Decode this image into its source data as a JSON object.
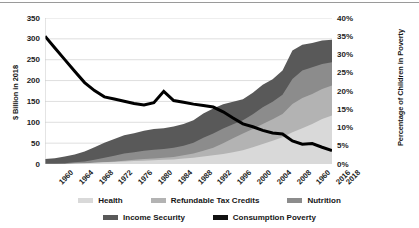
{
  "chart_data": {
    "type": "area",
    "title": "",
    "subtitle": "",
    "xlabel": "",
    "ylabel": "$ Billion in 2018",
    "y2label": "Percentage of Children in Poverty",
    "grid": true,
    "legend_position": "bottom",
    "xlim": [
      1960,
      2018
    ],
    "ylim": [
      0,
      350
    ],
    "y2lim": [
      0,
      40
    ],
    "x": [
      1960,
      1962,
      1964,
      1966,
      1968,
      1970,
      1972,
      1974,
      1976,
      1978,
      1980,
      1982,
      1984,
      1986,
      1988,
      1990,
      1992,
      1994,
      1996,
      1998,
      2000,
      2002,
      2004,
      2006,
      2008,
      2010,
      2012,
      2014,
      2016,
      2018
    ],
    "x_tick_labels": [
      "1960",
      "1964",
      "1968",
      "1972",
      "1976",
      "1980",
      "1984",
      "1988",
      "1992",
      "1996",
      "2000",
      "2004",
      "2008",
      "1960",
      "2016",
      "2018"
    ],
    "y_tick_labels": [
      "350",
      "300",
      "250",
      "200",
      "150",
      "100",
      "50",
      "0"
    ],
    "y2_tick_labels": [
      "40%",
      "35%",
      "30%",
      "25%",
      "20%",
      "15%",
      "10%",
      "5%",
      "0%"
    ],
    "stack_order_bottom_to_top": [
      "Health",
      "Refundable Tax Credits",
      "Nutrition",
      "Income Security"
    ],
    "series": [
      {
        "name": "Health",
        "kind": "area",
        "axis": "left",
        "color": "#d9d9d9",
        "values": [
          0,
          0,
          0,
          1,
          2,
          3,
          4,
          5,
          6,
          7,
          8,
          9,
          10,
          11,
          13,
          15,
          18,
          21,
          24,
          28,
          33,
          40,
          48,
          56,
          64,
          76,
          86,
          96,
          108,
          116
        ]
      },
      {
        "name": "Refundable Tax Credits",
        "kind": "area",
        "axis": "left",
        "color": "#b3b3b3",
        "values": [
          0,
          0,
          0,
          0,
          0,
          0,
          0,
          1,
          2,
          3,
          4,
          4,
          5,
          6,
          8,
          10,
          14,
          18,
          26,
          34,
          40,
          44,
          48,
          51,
          56,
          68,
          72,
          72,
          72,
          72
        ]
      },
      {
        "name": "Nutrition",
        "kind": "area",
        "axis": "left",
        "color": "#8c8c8c",
        "values": [
          1,
          1,
          2,
          3,
          4,
          7,
          11,
          14,
          17,
          18,
          20,
          21,
          21,
          22,
          23,
          26,
          31,
          34,
          35,
          33,
          32,
          35,
          40,
          42,
          46,
          60,
          66,
          64,
          60,
          56
        ]
      },
      {
        "name": "Income Security",
        "kind": "area",
        "axis": "left",
        "color": "#595959",
        "values": [
          11,
          13,
          16,
          19,
          24,
          30,
          36,
          40,
          44,
          46,
          48,
          50,
          50,
          51,
          52,
          54,
          58,
          60,
          58,
          54,
          50,
          52,
          54,
          54,
          58,
          68,
          62,
          58,
          56,
          54
        ]
      },
      {
        "name": "Consumption Poverty",
        "kind": "line",
        "axis": "right",
        "color": "#000000",
        "values": [
          35.0,
          31.8,
          28.6,
          25.4,
          22.3,
          20.1,
          18.4,
          17.8,
          17.2,
          16.6,
          16.2,
          16.8,
          19.9,
          17.4,
          16.9,
          16.4,
          16.0,
          15.6,
          14.3,
          12.6,
          11.0,
          10.2,
          9.2,
          8.5,
          8.2,
          6.3,
          5.4,
          5.6,
          4.6,
          3.7
        ]
      }
    ]
  },
  "axes": {
    "y_left": {
      "title": "$ Billion in 2018",
      "ticks": [
        "350",
        "300",
        "250",
        "200",
        "150",
        "100",
        "50",
        "0"
      ]
    },
    "y_right": {
      "title": "Percentage of Children in Poverty",
      "ticks": [
        "40%",
        "35%",
        "30%",
        "25%",
        "20%",
        "15%",
        "10%",
        "5%",
        "0%"
      ]
    },
    "x": {
      "ticks": [
        "1960",
        "1964",
        "1968",
        "1972",
        "1976",
        "1980",
        "1984",
        "1988",
        "1992",
        "1996",
        "2000",
        "2004",
        "2008",
        "1960",
        "2016",
        "2018"
      ]
    }
  },
  "legend": {
    "rows": [
      [
        {
          "label": "Health",
          "color": "#d9d9d9"
        },
        {
          "label": "Refundable Tax Credits",
          "color": "#b3b3b3"
        },
        {
          "label": "Nutrition",
          "color": "#8c8c8c"
        }
      ],
      [
        {
          "label": "Income Security",
          "color": "#595959"
        },
        {
          "label": "Consumption Poverty",
          "color": "#111111"
        }
      ]
    ]
  },
  "colors": {
    "health": "#d9d9d9",
    "refundable_tax_credits": "#b3b3b3",
    "nutrition": "#8c8c8c",
    "income_security": "#595959",
    "consumption_poverty": "#000000",
    "gridline": "#d6d6d6",
    "background": "#ffffff"
  }
}
